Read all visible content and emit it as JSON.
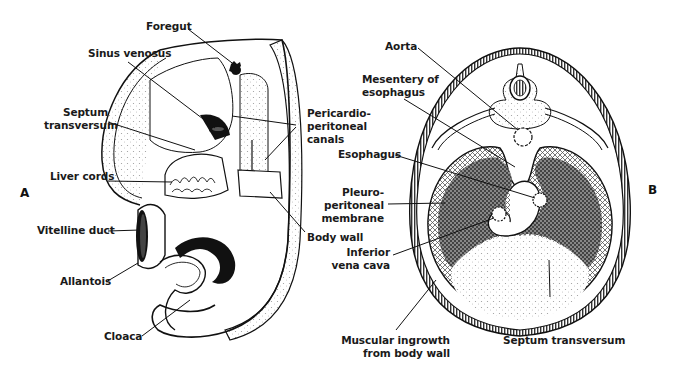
{
  "figure": {
    "panels": [
      {
        "id": "A",
        "letter": "A",
        "description": "Lateral view of embryo showing septum transversum and pericardioperitoneal canals",
        "labels": {
          "foregut": "Foregut",
          "sinus_venosus": "Sinus venosus",
          "septum_transversum_1": "Septum",
          "septum_transversum_2": "transversum",
          "pericardio_1": "Pericardio-",
          "pericardio_2": "peritoneal",
          "pericardio_3": "canals",
          "liver_cords": "Liver cords",
          "body_wall": "Body wall",
          "vitelline_duct": "Vitelline duct",
          "allantois": "Allantois",
          "cloaca": "Cloaca"
        }
      },
      {
        "id": "B",
        "letter": "B",
        "description": "Transverse section showing pleuroperitoneal membranes and diaphragm development",
        "labels": {
          "aorta": "Aorta",
          "mesentery_1": "Mesentery of",
          "mesentery_2": "esophagus",
          "esophagus": "Esophagus",
          "pleuro_1": "Pleuro-",
          "pleuro_2": "peritoneal",
          "pleuro_3": "membrane",
          "ivc_1": "Inferior",
          "ivc_2": "vena cava",
          "muscular_1": "Muscular ingrowth",
          "muscular_2": "from body wall",
          "septum_transversum": "Septum transversum"
        }
      }
    ],
    "colors": {
      "ink": "#111111",
      "dark_fill": "#3a3a3a",
      "stipple": "#9a9a9a",
      "background": "#ffffff"
    }
  }
}
